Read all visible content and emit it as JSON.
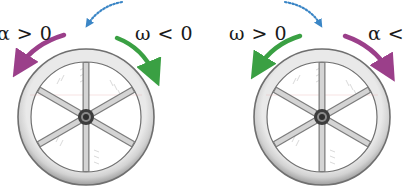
{
  "diagram": {
    "panels": [
      {
        "id": "left",
        "wheel_center": [
          86,
          117
        ],
        "labels": [
          {
            "text": "α > 0",
            "meaning": "angular-acceleration-positive",
            "color": "#9b3f8a"
          },
          {
            "text": "ω < 0",
            "meaning": "angular-velocity-negative",
            "color": "#3aa043"
          }
        ],
        "arrows": [
          {
            "kind": "alpha",
            "direction": "counterclockwise",
            "color": "#9b3f8a"
          },
          {
            "kind": "omega",
            "direction": "clockwise",
            "color": "#3aa043"
          }
        ]
      },
      {
        "id": "right",
        "wheel_center": [
          322,
          117
        ],
        "labels": [
          {
            "text": "ω > 0",
            "meaning": "angular-velocity-positive",
            "color": "#3aa043"
          },
          {
            "text": "α <",
            "meaning": "angular-acceleration-negative",
            "color": "#9b3f8a"
          }
        ],
        "arrows": [
          {
            "kind": "omega",
            "direction": "counterclockwise",
            "color": "#3aa043"
          },
          {
            "kind": "alpha",
            "direction": "clockwise",
            "color": "#9b3f8a"
          }
        ]
      }
    ],
    "connector": {
      "style": "dotted",
      "color": "#3b86c6"
    },
    "colors": {
      "alpha": "#9b3f8a",
      "omega": "#3aa043",
      "connector": "#3b86c6",
      "wheel_rim": "#c9c9c9",
      "wheel_outline": "#6f6f6f",
      "spoke": "#b5b5b5",
      "hub": "#3c3c3c"
    }
  }
}
